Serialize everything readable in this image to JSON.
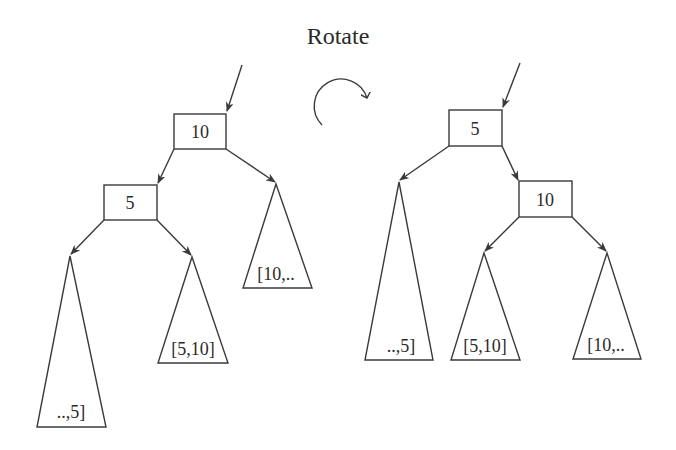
{
  "title": "Rotate",
  "rotation_icon": "clockwise-arrow-icon",
  "before": {
    "root": {
      "label": "10"
    },
    "left_child": {
      "label": "5"
    },
    "subtrees": [
      {
        "label": "..,5]"
      },
      {
        "label": "[5,10]"
      },
      {
        "label": "[10,.."
      }
    ]
  },
  "after": {
    "root": {
      "label": "5"
    },
    "right_child": {
      "label": "10"
    },
    "subtrees": [
      {
        "label": "..,5]"
      },
      {
        "label": "[5,10]"
      },
      {
        "label": "[10,.."
      }
    ]
  },
  "colors": {
    "stroke": "#3a3a3a",
    "text": "#2a2a2a",
    "background": "#ffffff"
  }
}
